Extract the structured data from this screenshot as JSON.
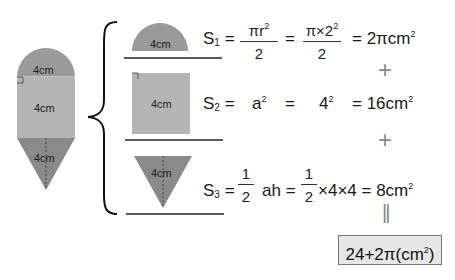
{
  "figure": {
    "shape_labels": {
      "semicircle": "4cm",
      "square": "4cm",
      "triangle": "4cm"
    },
    "colors": {
      "semicircle": "#9a9a9a",
      "square": "#b4b4b4",
      "triangle": "#8a8a8a",
      "result_bg": "#e6e6e6"
    }
  },
  "equations": {
    "s1": {
      "name": "S",
      "sub": "1",
      "frac1_num": "πr",
      "frac1_num_sup": "2",
      "frac1_den": "2",
      "frac2_num": "π×2",
      "frac2_num_sup": "2",
      "frac2_den": "2",
      "result": "= 2πcm",
      "result_sup": "2"
    },
    "s2": {
      "name": "S",
      "sub": "2",
      "expr1": "a",
      "expr1_sup": "2",
      "expr2": "4",
      "expr2_sup": "2",
      "result": "= 16cm",
      "result_sup": "2"
    },
    "s3": {
      "name": "S",
      "sub": "3",
      "frac_num": "1",
      "frac_den": "2",
      "expr1": "ah =",
      "frac2_num": "1",
      "frac2_den": "2",
      "expr2": "×4×4 = 8cm",
      "result_sup": "2"
    },
    "equals": "=",
    "plus1": "+",
    "plus2": "+",
    "equals_vertical": "||"
  },
  "result": {
    "text": "24+2π(cm",
    "sup": "2",
    "close": ")"
  }
}
